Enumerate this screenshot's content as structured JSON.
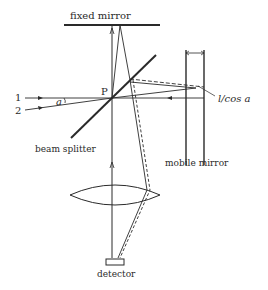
{
  "diagram": {
    "type": "Michelson interferometer optical path",
    "labels": {
      "fixed_mirror": "fixed mirror",
      "mobile_mirror": "mobile mirror",
      "beam_splitter": "beam splitter",
      "detector": "detector",
      "point": "P",
      "beam_1": "1",
      "beam_2": "2",
      "angle": "a",
      "path_length": "l/cos a"
    },
    "colors": {
      "line": "#2a2a2a",
      "background": "#ffffff"
    }
  }
}
